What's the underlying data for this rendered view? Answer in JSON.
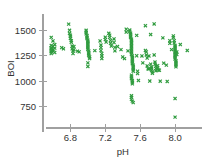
{
  "chart_data": {
    "type": "scatter",
    "title": "",
    "subtitle": "",
    "xlabel": "pH",
    "ylabel": "BOI",
    "xlim": [
      6.52,
      8.24
    ],
    "ylim": [
      600,
      1640
    ],
    "xticks": [
      6.8,
      7.2,
      7.6,
      8.0
    ],
    "xtick_labels": [
      "6.8",
      "7.2",
      "7.6",
      "8.0"
    ],
    "yticks": [
      750,
      1000,
      1250,
      1500
    ],
    "ytick_labels": [
      "750",
      "1000",
      "1250",
      "1500"
    ],
    "grid": false,
    "legend": null,
    "legend_position": "none",
    "marker": "x",
    "marker_color": "#2f9b3e",
    "axis_color": "#a0a0a0",
    "text_color": "#333333",
    "background_color": "#ffffff",
    "n_points": 236,
    "series": [
      {
        "name": "samples",
        "color": "#2f9b3e",
        "points": [
          [
            6.58,
            1430
          ],
          [
            6.58,
            1352
          ],
          [
            6.58,
            1330
          ],
          [
            6.58,
            1318
          ],
          [
            6.58,
            1300
          ],
          [
            6.58,
            1288
          ],
          [
            6.58,
            1272
          ],
          [
            6.6,
            1395
          ],
          [
            6.6,
            1340
          ],
          [
            6.6,
            1310
          ],
          [
            6.6,
            1295
          ],
          [
            6.62,
            1360
          ],
          [
            6.62,
            1325
          ],
          [
            6.62,
            1282
          ],
          [
            6.7,
            1330
          ],
          [
            6.72,
            1318
          ],
          [
            6.78,
            1560
          ],
          [
            6.79,
            1500
          ],
          [
            6.79,
            1470
          ],
          [
            6.8,
            1452
          ],
          [
            6.8,
            1438
          ],
          [
            6.8,
            1420
          ],
          [
            6.81,
            1398
          ],
          [
            6.81,
            1382
          ],
          [
            6.82,
            1345
          ],
          [
            6.82,
            1318
          ],
          [
            6.83,
            1298
          ],
          [
            6.83,
            1272
          ],
          [
            6.84,
            1340
          ],
          [
            6.84,
            1310
          ],
          [
            6.88,
            1295
          ],
          [
            6.9,
            1288
          ],
          [
            6.98,
            1500
          ],
          [
            6.98,
            1482
          ],
          [
            6.98,
            1465
          ],
          [
            6.99,
            1448
          ],
          [
            6.99,
            1432
          ],
          [
            6.99,
            1418
          ],
          [
            7.0,
            1402
          ],
          [
            7.0,
            1388
          ],
          [
            7.0,
            1372
          ],
          [
            7.0,
            1358
          ],
          [
            7.0,
            1342
          ],
          [
            7.0,
            1328
          ],
          [
            7.0,
            1312
          ],
          [
            7.01,
            1298
          ],
          [
            7.01,
            1282
          ],
          [
            7.01,
            1268
          ],
          [
            7.01,
            1252
          ],
          [
            7.02,
            1238
          ],
          [
            7.02,
            1222
          ],
          [
            7.0,
            1180
          ],
          [
            7.0,
            1145
          ],
          [
            7.08,
            1300
          ],
          [
            7.14,
            1395
          ],
          [
            7.15,
            1355
          ],
          [
            7.15,
            1330
          ],
          [
            7.15,
            1300
          ],
          [
            7.16,
            1272
          ],
          [
            7.16,
            1248
          ],
          [
            7.16,
            1222
          ],
          [
            7.2,
            1432
          ],
          [
            7.2,
            1408
          ],
          [
            7.21,
            1385
          ],
          [
            7.24,
            1470
          ],
          [
            7.25,
            1452
          ],
          [
            7.25,
            1430
          ],
          [
            7.26,
            1400
          ],
          [
            7.26,
            1372
          ],
          [
            7.27,
            1345
          ],
          [
            7.3,
            1415
          ],
          [
            7.3,
            1380
          ],
          [
            7.31,
            1332
          ],
          [
            7.31,
            1298
          ],
          [
            7.34,
            1340
          ],
          [
            7.38,
            1310
          ],
          [
            7.4,
            1238
          ],
          [
            7.42,
            1222
          ],
          [
            7.44,
            1510
          ],
          [
            7.44,
            1482
          ],
          [
            7.46,
            1298
          ],
          [
            7.48,
            1502
          ],
          [
            7.48,
            1488
          ],
          [
            7.49,
            1472
          ],
          [
            7.49,
            1458
          ],
          [
            7.49,
            1442
          ],
          [
            7.49,
            1428
          ],
          [
            7.5,
            1412
          ],
          [
            7.5,
            1398
          ],
          [
            7.5,
            1382
          ],
          [
            7.5,
            1368
          ],
          [
            7.5,
            1352
          ],
          [
            7.5,
            1338
          ],
          [
            7.5,
            1322
          ],
          [
            7.5,
            1308
          ],
          [
            7.5,
            1292
          ],
          [
            7.5,
            1278
          ],
          [
            7.5,
            1262
          ],
          [
            7.51,
            1248
          ],
          [
            7.51,
            1232
          ],
          [
            7.51,
            1218
          ],
          [
            7.51,
            1202
          ],
          [
            7.51,
            1188
          ],
          [
            7.51,
            1172
          ],
          [
            7.52,
            1158
          ],
          [
            7.52,
            1142
          ],
          [
            7.52,
            1128
          ],
          [
            7.52,
            1112
          ],
          [
            7.52,
            1098
          ],
          [
            7.5,
            1060
          ],
          [
            7.5,
            1042
          ],
          [
            7.5,
            1025
          ],
          [
            7.51,
            1008
          ],
          [
            7.51,
            992
          ],
          [
            7.51,
            975
          ],
          [
            7.5,
            858
          ],
          [
            7.5,
            842
          ],
          [
            7.5,
            822
          ],
          [
            7.51,
            805
          ],
          [
            7.52,
            790
          ],
          [
            7.56,
            1450
          ],
          [
            7.56,
            1250
          ],
          [
            7.57,
            1098
          ],
          [
            7.57,
            1075
          ],
          [
            7.58,
            1008
          ],
          [
            7.62,
            1248
          ],
          [
            7.63,
            1180
          ],
          [
            7.66,
            1545
          ],
          [
            7.66,
            1302
          ],
          [
            7.67,
            1288
          ],
          [
            7.67,
            1258
          ],
          [
            7.68,
            1228
          ],
          [
            7.68,
            1150
          ],
          [
            7.69,
            1122
          ],
          [
            7.7,
            1248
          ],
          [
            7.7,
            1120
          ],
          [
            7.71,
            1002
          ],
          [
            7.72,
            1458
          ],
          [
            7.72,
            1168
          ],
          [
            7.73,
            1140
          ],
          [
            7.73,
            1128
          ],
          [
            7.73,
            1108
          ],
          [
            7.74,
            1092
          ],
          [
            7.74,
            1078
          ],
          [
            7.76,
            1562
          ],
          [
            7.76,
            1258
          ],
          [
            7.77,
            1188
          ],
          [
            7.77,
            1168
          ],
          [
            7.78,
            1148
          ],
          [
            7.78,
            1125
          ],
          [
            7.78,
            1102
          ],
          [
            7.8,
            1152
          ],
          [
            7.8,
            1130
          ],
          [
            7.81,
            1110
          ],
          [
            7.82,
            1108
          ],
          [
            7.83,
            1000
          ],
          [
            7.86,
            1425
          ],
          [
            7.87,
            1178
          ],
          [
            7.9,
            1158
          ],
          [
            7.91,
            998
          ],
          [
            7.94,
            1398
          ],
          [
            7.94,
            1372
          ],
          [
            7.96,
            1310
          ],
          [
            7.98,
            1445
          ],
          [
            7.98,
            1428
          ],
          [
            7.99,
            1398
          ],
          [
            7.99,
            1375
          ],
          [
            8.0,
            1352
          ],
          [
            8.0,
            1338
          ],
          [
            8.0,
            1322
          ],
          [
            8.0,
            1308
          ],
          [
            8.0,
            1292
          ],
          [
            8.0,
            1278
          ],
          [
            8.0,
            1262
          ],
          [
            8.0,
            1248
          ],
          [
            8.0,
            1232
          ],
          [
            8.0,
            1218
          ],
          [
            8.01,
            1202
          ],
          [
            8.01,
            1188
          ],
          [
            8.01,
            1172
          ],
          [
            8.01,
            1158
          ],
          [
            8.01,
            1142
          ],
          [
            8.02,
            1288
          ],
          [
            8.02,
            1262
          ],
          [
            8.0,
            830
          ],
          [
            8.0,
            648
          ],
          [
            8.06,
            1360
          ],
          [
            8.14,
            1302
          ]
        ]
      }
    ]
  }
}
